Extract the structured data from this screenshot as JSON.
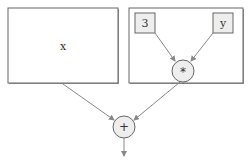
{
  "diagram": {
    "type": "expression-tree",
    "nodes": {
      "x_box": {
        "label": "x"
      },
      "const_box": {
        "label": "3"
      },
      "y_box": {
        "label": "y"
      },
      "mul_node": {
        "label": "*"
      },
      "add_node": {
        "label": "+"
      }
    },
    "edges": [
      {
        "from": "3",
        "to": "*"
      },
      {
        "from": "y",
        "to": "*"
      },
      {
        "from": "x",
        "to": "+"
      },
      {
        "from": "*",
        "to": "+"
      },
      {
        "from": "+",
        "to": "output"
      }
    ],
    "colors": {
      "box_fill": "#ffffff",
      "leaf_fill": "#eeeeee",
      "node_fill": "#eeeeee",
      "stroke": "#555555",
      "arrow": "#888888"
    }
  }
}
